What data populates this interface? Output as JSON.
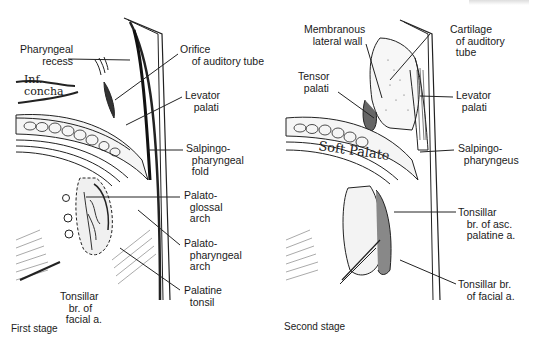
{
  "figure": {
    "panels": [
      {
        "caption": "First stage",
        "labels": {
          "pharyngeal_recess": "Pharyngeal\n   recess",
          "orifice_auditory_tube": "Orifice\n    of auditory tube",
          "inf_concha": "Inf.\nconcha",
          "levator_palati": "Levator\n   palati",
          "salpingopharyngeal_fold": "Salpingo-\n  pharyngeal\n  fold",
          "palatoglossal_arch": "Palato-\n  glossal\n  arch",
          "palatopharyngeal_arch": "Palato-\n  pharyngeal\n  arch",
          "palatine_tonsil": "Palatine\n  tonsil",
          "tonsillar_br_facial": "Tonsillar\n   br. of\n  facial a."
        }
      },
      {
        "caption": "Second stage",
        "labels": {
          "membranous_lateral_wall": "Membranous\n   lateral wall",
          "cartilage_auditory_tube": "Cartilage\n  of auditory\n  tube",
          "tensor_palati": "Tensor\n  palati",
          "levator_palati": "Levator\n  palati",
          "soft_palate": "Soft Palate",
          "salpingopharyngeus": "Salpingo-\n  pharyngeus",
          "tonsillar_br_asc_palatine": "Tonsillar\n   br. of asc.\n   palatine a.",
          "tonsillar_br_facial": "Tonsillar br.\n   of facial a."
        }
      }
    ]
  }
}
